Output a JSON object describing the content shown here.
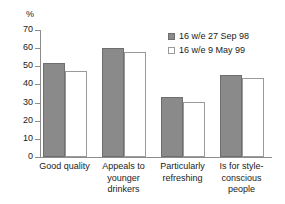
{
  "chart_data": {
    "type": "bar",
    "title": "",
    "subtitle": "",
    "xlabel": "",
    "ylabel": "%",
    "ylim": [
      0,
      70
    ],
    "yticks": [
      0,
      10,
      20,
      30,
      40,
      50,
      60,
      70
    ],
    "ytick_labels": [
      "0",
      "10",
      "20",
      "30",
      "40",
      "50",
      "60",
      "70"
    ],
    "grid": false,
    "legend_position": "top-right",
    "categories": [
      "Good quality",
      "Appeals to younger drinkers",
      "Particularly refreshing",
      "Is for style-conscious people"
    ],
    "category_label_lines": [
      [
        "Good quality"
      ],
      [
        "Appeals to",
        "younger",
        "drinkers"
      ],
      [
        "Particularly",
        "refreshing"
      ],
      [
        "Is for style-",
        "conscious",
        "people"
      ]
    ],
    "series": [
      {
        "name": "16 w/e 27 Sep 98",
        "values": [
          52,
          60,
          33,
          45
        ],
        "color": "#8a8a8a",
        "style": "filled"
      },
      {
        "name": "16 w/e 9 May 99",
        "values": [
          47.5,
          58,
          30.5,
          43.5
        ],
        "color": "#ffffff",
        "style": "open"
      }
    ]
  },
  "legend": {
    "entries": [
      {
        "label": "16 w/e 27 Sep 98",
        "swatch": "filled-gray-swatch"
      },
      {
        "label": "16 w/e 9 May 99",
        "swatch": "open-white-swatch"
      }
    ]
  },
  "axis": {
    "y_unit_label": "%"
  },
  "colors": {
    "series_one": "#8a8a8a",
    "series_one_border": "#6e6e6e",
    "series_two": "#ffffff",
    "series_two_border": "#9a9a9a",
    "axis": "#8c8c8c",
    "text": "#1a1a1a",
    "background": "#ffffff"
  }
}
